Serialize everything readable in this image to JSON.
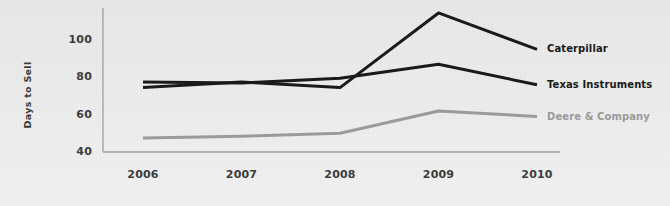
{
  "chart_data": {
    "type": "line",
    "title": "",
    "subtitle": "",
    "xlabel": "",
    "ylabel": "Days to Sell",
    "categories": [
      "2006",
      "2007",
      "2008",
      "2009",
      "2010"
    ],
    "x": [
      2006,
      2007,
      2008,
      2009,
      2010
    ],
    "xlim": [
      2006,
      2010
    ],
    "ylim": [
      40,
      118
    ],
    "yticks": [
      40,
      60,
      80,
      100
    ],
    "ytick_labels": [
      "40",
      "60",
      "80",
      "100"
    ],
    "xtick_labels": [
      "2006",
      "2007",
      "2008",
      "2009",
      "2010"
    ],
    "grid": false,
    "legend_position": "right-inline-end-of-line",
    "series": [
      {
        "name": "Caterpillar",
        "color": "#1a1a1a",
        "values": [
          74.5,
          77.5,
          74.5,
          114.5,
          95
        ]
      },
      {
        "name": "Texas Instruments",
        "color": "#1a1a1a",
        "values": [
          77.5,
          77,
          79.5,
          87,
          76
        ]
      },
      {
        "name": "Deere & Company",
        "color": "#9a9a9a",
        "values": [
          47.5,
          48.5,
          50,
          62,
          59
        ]
      }
    ]
  },
  "axis": {
    "y_title": "Days to Sell",
    "axis_color": "#9e9e9e"
  },
  "background": {
    "color": "#e8e8e8"
  }
}
